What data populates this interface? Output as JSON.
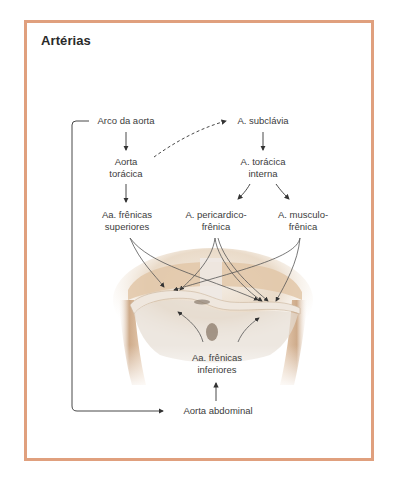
{
  "title": "Artérias",
  "colors": {
    "frame_border": "#e0a07e",
    "text": "#3c3c3c",
    "arrow": "#333333"
  },
  "nodes": {
    "arco_aorta": {
      "line1": "Arco da aorta"
    },
    "aorta_toracica": {
      "line1": "Aorta",
      "line2": "torácica"
    },
    "aa_frenicas_superiores": {
      "line1": "Aa. frênicas",
      "line2": "superiores"
    },
    "a_subclavia": {
      "line1": "A. subclávia"
    },
    "a_toracica_interna": {
      "line1": "A. torácica",
      "line2": "interna"
    },
    "a_pericardicofrenica": {
      "line1": "A. pericardico-",
      "line2": "frênica"
    },
    "a_musculofrenica": {
      "line1": "A. musculo-",
      "line2": "frênica"
    },
    "aa_frenicas_inferiores": {
      "line1": "Aa. frênicas",
      "line2": "inferiores"
    },
    "aorta_abdominal": {
      "line1": "Aorta abdominal"
    }
  },
  "illustration": {
    "subject": "diaphragm-anatomical-illustration"
  }
}
